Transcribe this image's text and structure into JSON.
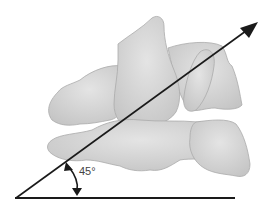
{
  "diagram": {
    "angle_label": "45°",
    "colors": {
      "bone_fill": "#d9d9d9",
      "bone_shade": "#bdbdbd",
      "bone_outline": "#a8a8a8",
      "line": "#1a1a1a",
      "label": "#444444"
    },
    "elements": [
      {
        "name": "baseline",
        "type": "horizontal-line"
      },
      {
        "name": "axis-arrow",
        "type": "arrow",
        "direction": "up-right"
      },
      {
        "name": "angle-indicator",
        "type": "double-headed-curved-arrow",
        "label": "45°"
      }
    ]
  }
}
